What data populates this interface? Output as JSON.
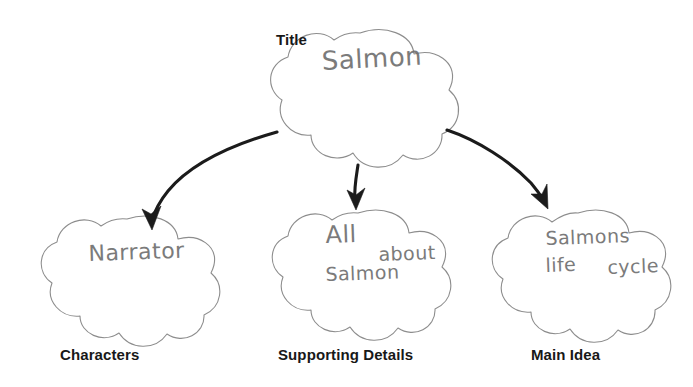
{
  "worksheet": {
    "type": "graphic-organizer",
    "background_color": "#ffffff",
    "printed_label_color": "#181818",
    "handwriting_color": "#707070",
    "cloud_outline_color": "#8d8d8d",
    "arrow_color": "#1b1b1b"
  },
  "nodes": {
    "title": {
      "printed_label": "Title",
      "handwriting": "Salmon"
    },
    "characters": {
      "printed_label": "Characters",
      "handwriting": "Narrator"
    },
    "supporting_details": {
      "printed_label": "Supporting Details",
      "handwriting_line1": "All",
      "handwriting_line2": "about",
      "handwriting_line3": "Salmon"
    },
    "main_idea": {
      "printed_label": "Main Idea",
      "handwriting_line1": "Salmons",
      "handwriting_line2": "life",
      "handwriting_line3": "cycle"
    }
  },
  "connectors": [
    {
      "name": "title-to-characters",
      "direction": "down-left"
    },
    {
      "name": "title-to-supporting-details",
      "direction": "down"
    },
    {
      "name": "title-to-main-idea",
      "direction": "down-right"
    }
  ]
}
